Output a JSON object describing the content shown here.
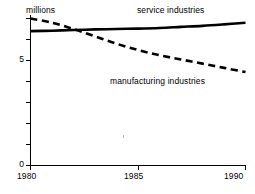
{
  "chart_data": {
    "type": "line",
    "title": "",
    "subtitle": "",
    "xlabel": "",
    "ylabel": "millions",
    "ylim": [
      0,
      7.6
    ],
    "xlim": [
      1980,
      1990
    ],
    "grid": false,
    "legend_position": "inline-annotation",
    "x_ticks": [
      1980,
      1985,
      1990
    ],
    "x_tick_labels": [
      "1980",
      "1985",
      "1990"
    ],
    "y_ticks": [
      0,
      1,
      2,
      3,
      4,
      5,
      6,
      7
    ],
    "y_tick_labels": [
      "0",
      "",
      "",
      "",
      "",
      "5",
      "",
      ""
    ],
    "y_labeled_ticks": [
      "0",
      "5"
    ],
    "x": [
      1980,
      1981,
      1982,
      1983,
      1984,
      1985,
      1986,
      1987,
      1988,
      1989,
      1990
    ],
    "series": [
      {
        "name": "service industries",
        "style": "solid",
        "color": "#000000",
        "values": [
          6.4,
          6.42,
          6.45,
          6.48,
          6.5,
          6.52,
          6.55,
          6.6,
          6.65,
          6.72,
          6.8
        ]
      },
      {
        "name": "manufacturing industries",
        "style": "dashed",
        "color": "#000000",
        "values": [
          7.0,
          6.8,
          6.5,
          6.15,
          5.8,
          5.5,
          5.25,
          5.05,
          4.85,
          4.65,
          4.45
        ]
      }
    ],
    "annotations": [
      {
        "text": "service industries",
        "x": 1986.5,
        "y": 7.35
      },
      {
        "text": "manufacturing industries",
        "x": 1985.9,
        "y": 4.0
      }
    ]
  },
  "axis": {
    "y_unit_label": "millions",
    "y_label_0": "0",
    "y_label_5": "5",
    "x_label_1980": "1980",
    "x_label_1985": "1985",
    "x_label_1990": "1990"
  },
  "labels": {
    "service": "service industries",
    "manufacturing": "manufacturing industries"
  }
}
